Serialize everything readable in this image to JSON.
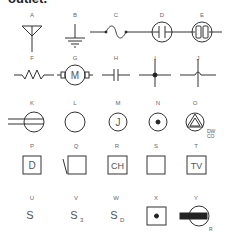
{
  "heading": "outlet.",
  "symbols": [
    {
      "letter": "A",
      "name": "antenna"
    },
    {
      "letter": "B",
      "name": "ground"
    },
    {
      "letter": "C",
      "name": "fuse"
    },
    {
      "letter": "D",
      "name": "lamp-gap"
    },
    {
      "letter": "E",
      "name": "lamp-double"
    },
    {
      "letter": "F",
      "name": "resistor"
    },
    {
      "letter": "G",
      "name": "motor",
      "text": "M"
    },
    {
      "letter": "H",
      "name": "capacitor"
    },
    {
      "letter": "I",
      "name": "wires-connected"
    },
    {
      "letter": "J",
      "name": "wires-crossing"
    },
    {
      "letter": "K",
      "name": "duplex-outlet"
    },
    {
      "letter": "L",
      "name": "ceiling-outlet"
    },
    {
      "letter": "M",
      "name": "junction-box",
      "text": "J"
    },
    {
      "letter": "N",
      "name": "floor-outlet"
    },
    {
      "letter": "O",
      "name": "special-outlet",
      "note1": "DW",
      "note2": "CO"
    },
    {
      "letter": "P",
      "name": "box-d",
      "text": "D"
    },
    {
      "letter": "Q",
      "name": "box-slash"
    },
    {
      "letter": "R",
      "name": "box-ch",
      "text": "CH"
    },
    {
      "letter": "S",
      "name": "box-empty"
    },
    {
      "letter": "T",
      "name": "box-tv",
      "text": "TV"
    },
    {
      "letter": "U",
      "name": "switch",
      "text": "S"
    },
    {
      "letter": "V",
      "name": "three-way-switch",
      "text": "S",
      "sub": "3"
    },
    {
      "letter": "W",
      "name": "door-switch",
      "text": "S",
      "sub": "D"
    },
    {
      "letter": "X",
      "name": "push-button"
    },
    {
      "letter": "Y",
      "name": "range-outlet",
      "note1": "R"
    }
  ]
}
